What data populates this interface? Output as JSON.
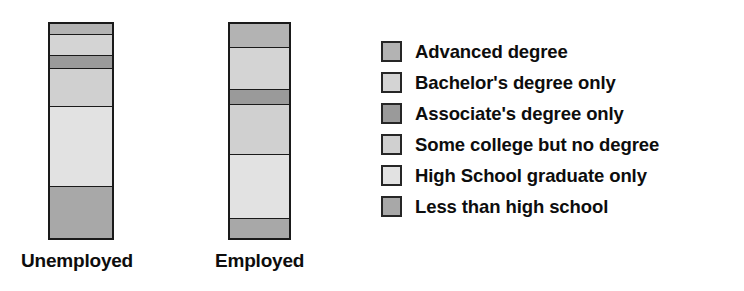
{
  "chart_data": {
    "type": "bar",
    "title": "",
    "subtitle": "",
    "xlabel": "",
    "ylabel": "",
    "stacked": true,
    "normalized": "100% stacked",
    "grid": false,
    "legend_position": "right",
    "categories": [
      "Unemployed",
      "Employed"
    ],
    "series": [
      {
        "name": "Advanced degree",
        "color": "#b3b3b3",
        "values": [
          5,
          11
        ]
      },
      {
        "name": "Bachelor's degree only",
        "color": "#d4d4d4",
        "values": [
          10,
          20
        ]
      },
      {
        "name": "Associate's degree only",
        "color": "#9a9a9a",
        "values": [
          6,
          7
        ]
      },
      {
        "name": "Some college but no degree",
        "color": "#d0d0d0",
        "values": [
          18,
          23
        ]
      },
      {
        "name": "High School graduate only",
        "color": "#e2e2e2",
        "values": [
          37,
          30
        ]
      },
      {
        "name": "Less than high school",
        "color": "#a8a8a8",
        "values": [
          24,
          9
        ]
      }
    ],
    "stack_order": "top-to-bottom",
    "ylim": [
      0,
      100
    ]
  },
  "bars": {
    "unemployed": {
      "label": "Unemployed",
      "segments": [
        {
          "name": "Advanced degree",
          "percent": 5,
          "color": "#b3b3b3"
        },
        {
          "name": "Bachelor's degree only",
          "percent": 10,
          "color": "#d4d4d4"
        },
        {
          "name": "Associate's degree only",
          "percent": 6,
          "color": "#9a9a9a"
        },
        {
          "name": "Some college but no degree",
          "percent": 18,
          "color": "#d0d0d0"
        },
        {
          "name": "High School graduate only",
          "percent": 37,
          "color": "#e2e2e2"
        },
        {
          "name": "Less than high school",
          "percent": 24,
          "color": "#a8a8a8"
        }
      ]
    },
    "employed": {
      "label": "Employed",
      "segments": [
        {
          "name": "Advanced degree",
          "percent": 11,
          "color": "#b3b3b3"
        },
        {
          "name": "Bachelor's degree only",
          "percent": 20,
          "color": "#d4d4d4"
        },
        {
          "name": "Associate's degree only",
          "percent": 7,
          "color": "#9a9a9a"
        },
        {
          "name": "Some college but no degree",
          "percent": 23,
          "color": "#d0d0d0"
        },
        {
          "name": "High School graduate only",
          "percent": 30,
          "color": "#e2e2e2"
        },
        {
          "name": "Less than high school",
          "percent": 9,
          "color": "#a8a8a8"
        }
      ]
    }
  },
  "legend": {
    "items": [
      {
        "label": "Advanced degree",
        "color": "#b3b3b3"
      },
      {
        "label": "Bachelor's degree only",
        "color": "#d4d4d4"
      },
      {
        "label": "Associate's degree only",
        "color": "#9a9a9a"
      },
      {
        "label": "Some college but no degree",
        "color": "#d0d0d0"
      },
      {
        "label": "High School graduate only",
        "color": "#e2e2e2"
      },
      {
        "label": "Less than high school",
        "color": "#a8a8a8"
      }
    ]
  }
}
